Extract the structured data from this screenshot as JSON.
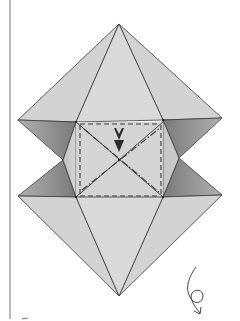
{
  "diagram": {
    "colors": {
      "background": "#ffffff",
      "paper_light": "#d6d6d6",
      "paper_mid": "#c4c4c4",
      "paper_dark": "#8e8e8e",
      "line": "#3a3a3a",
      "margin_line": "#8a8a8a"
    },
    "symbols": [
      {
        "name": "push-arrow",
        "meaning": "push in / sink at center"
      },
      {
        "name": "turn-over-arrow",
        "meaning": "turn model over"
      },
      {
        "name": "valley-fold-lines",
        "meaning": "dashed rectangle"
      },
      {
        "name": "mountain-fold-lines",
        "meaning": "dash-dot diagonals"
      }
    ]
  }
}
